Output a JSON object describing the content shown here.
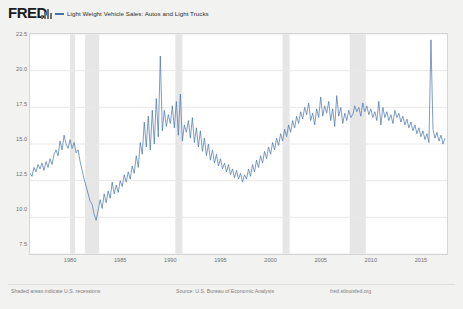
{
  "header": {
    "logo": "FRED",
    "logo_icon": "fred-bars-icon",
    "legend": [
      {
        "label": "Light Weight Vehicle Sales: Autos and Light Trucks",
        "color": "#4572a7"
      }
    ]
  },
  "footer": {
    "left_note": "Shaded areas indicate U.S. recessions",
    "source": "Source: U.S. Bureau of Economic Analysis",
    "site": "fred.stlouisfed.org"
  },
  "colors": {
    "series_line": "#4572a7",
    "recession_band": "#e6e6e6",
    "gridline": "#e8e8e8",
    "plot_background": "#ffffff",
    "page_background": "#f2f2f0",
    "axis_text": "#707070"
  },
  "chart_data": {
    "type": "line",
    "title": "Light Weight Vehicle Sales: Autos and Light Trucks",
    "xlabel": "",
    "ylabel": "Millions of Units",
    "ylim": [
      7.5,
      22.5
    ],
    "xlim": [
      1976.0,
      2017.6
    ],
    "ytick_labels": [
      "22.5",
      "20.0",
      "17.5",
      "15.0",
      "12.5",
      "10.0",
      "7.5"
    ],
    "ytick_values": [
      22.5,
      20.0,
      17.5,
      15.0,
      12.5,
      10.0,
      7.5
    ],
    "xtick_labels": [
      "1980",
      "1985",
      "1990",
      "1995",
      "2000",
      "2005",
      "2010",
      "2015"
    ],
    "xtick_values": [
      1980,
      1985,
      1990,
      1995,
      2000,
      2005,
      2010,
      2015
    ],
    "grid": true,
    "legend_position": "top-left",
    "annotations": [
      "Shaded areas indicate U.S. recessions",
      "Source: U.S. Bureau of Economic Analysis",
      "fred.stlouisfed.org"
    ],
    "recession_bands": [
      {
        "start": 1980.0,
        "end": 1980.5
      },
      {
        "start": 1981.5,
        "end": 1982.9
      },
      {
        "start": 1990.5,
        "end": 1991.2
      },
      {
        "start": 2001.2,
        "end": 2001.9
      },
      {
        "start": 2007.9,
        "end": 2009.5
      }
    ],
    "series": [
      {
        "name": "Light Weight Vehicle Sales: Autos and Light Trucks",
        "color": "#4572a7",
        "x": [
          1976.0,
          1976.2,
          1976.4,
          1976.6,
          1976.8,
          1977.0,
          1977.2,
          1977.4,
          1977.6,
          1977.8,
          1978.0,
          1978.2,
          1978.4,
          1978.6,
          1978.8,
          1979.0,
          1979.2,
          1979.4,
          1979.6,
          1979.8,
          1980.0,
          1980.2,
          1980.4,
          1980.6,
          1980.8,
          1981.0,
          1981.2,
          1981.4,
          1981.6,
          1981.8,
          1982.0,
          1982.2,
          1982.4,
          1982.6,
          1982.8,
          1983.0,
          1983.2,
          1983.4,
          1983.6,
          1983.8,
          1984.0,
          1984.2,
          1984.4,
          1984.6,
          1984.8,
          1985.0,
          1985.2,
          1985.4,
          1985.6,
          1985.8,
          1986.0,
          1986.2,
          1986.4,
          1986.6,
          1986.8,
          1987.0,
          1987.2,
          1987.4,
          1987.6,
          1987.8,
          1988.0,
          1988.2,
          1988.4,
          1988.6,
          1988.8,
          1989.0,
          1989.2,
          1989.4,
          1989.6,
          1989.8,
          1990.0,
          1990.2,
          1990.4,
          1990.6,
          1990.8,
          1991.0,
          1991.2,
          1991.4,
          1991.6,
          1991.8,
          1992.0,
          1992.2,
          1992.4,
          1992.6,
          1992.8,
          1993.0,
          1993.2,
          1993.4,
          1993.6,
          1993.8,
          1994.0,
          1994.2,
          1994.4,
          1994.6,
          1994.8,
          1995.0,
          1995.2,
          1995.4,
          1995.6,
          1995.8,
          1996.0,
          1996.2,
          1996.4,
          1996.6,
          1996.8,
          1997.0,
          1997.2,
          1997.4,
          1997.6,
          1997.8,
          1998.0,
          1998.2,
          1998.4,
          1998.6,
          1998.8,
          1999.0,
          1999.2,
          1999.4,
          1999.6,
          1999.8,
          2000.0,
          2000.2,
          2000.4,
          2000.6,
          2000.8,
          2001.0,
          2001.2,
          2001.4,
          2001.6,
          2001.8,
          2002.0,
          2002.2,
          2002.4,
          2002.6,
          2002.8,
          2003.0,
          2003.2,
          2003.4,
          2003.6,
          2003.8,
          2004.0,
          2004.2,
          2004.4,
          2004.6,
          2004.8,
          2005.0,
          2005.2,
          2005.4,
          2005.6,
          2005.8,
          2006.0,
          2006.2,
          2006.4,
          2006.6,
          2006.8,
          2007.0,
          2007.2,
          2007.4,
          2007.6,
          2007.8,
          2008.0,
          2008.2,
          2008.4,
          2008.6,
          2008.8,
          2009.0,
          2009.2,
          2009.4,
          2009.6,
          2009.8,
          2010.0,
          2010.2,
          2010.4,
          2010.6,
          2010.8,
          2011.0,
          2011.2,
          2011.4,
          2011.6,
          2011.8,
          2012.0,
          2012.2,
          2012.4,
          2012.6,
          2012.8,
          2013.0,
          2013.2,
          2013.4,
          2013.6,
          2013.8,
          2014.0,
          2014.2,
          2014.4,
          2014.6,
          2014.8,
          2015.0,
          2015.2,
          2015.4,
          2015.6,
          2015.8,
          2016.0,
          2016.2,
          2016.4,
          2016.6,
          2016.8,
          2017.0,
          2017.2,
          2017.4
        ],
        "y": [
          13.0,
          12.8,
          13.4,
          13.1,
          13.6,
          13.3,
          13.7,
          13.2,
          13.8,
          13.4,
          14.0,
          13.6,
          14.3,
          14.6,
          14.2,
          15.2,
          14.6,
          15.6,
          15.0,
          14.7,
          15.3,
          14.7,
          15.1,
          14.4,
          14.6,
          13.8,
          13.2,
          12.6,
          12.1,
          11.6,
          11.1,
          10.9,
          10.2,
          9.8,
          10.5,
          11.2,
          10.6,
          11.6,
          11.0,
          11.8,
          11.3,
          12.4,
          11.6,
          12.2,
          11.7,
          12.5,
          12.1,
          12.9,
          12.4,
          13.1,
          12.6,
          13.5,
          13.0,
          14.2,
          13.4,
          15.1,
          14.3,
          16.5,
          14.8,
          16.9,
          14.6,
          17.3,
          15.0,
          18.1,
          15.5,
          21.0,
          15.9,
          17.3,
          16.2,
          17.0,
          16.4,
          17.6,
          16.1,
          17.9,
          15.6,
          18.4,
          15.2,
          16.3,
          15.8,
          16.6,
          15.4,
          16.8,
          15.1,
          16.1,
          14.8,
          15.9,
          14.5,
          15.4,
          14.2,
          15.0,
          13.9,
          14.6,
          13.7,
          14.3,
          13.5,
          14.0,
          13.3,
          13.7,
          13.1,
          13.6,
          12.9,
          13.3,
          12.7,
          13.2,
          12.6,
          13.0,
          12.4,
          12.9,
          12.6,
          13.3,
          12.8,
          13.6,
          13.1,
          13.9,
          13.4,
          14.2,
          13.7,
          14.5,
          14.0,
          14.8,
          14.3,
          15.1,
          14.6,
          15.4,
          14.9,
          15.7,
          15.2,
          16.0,
          15.5,
          16.3,
          15.8,
          16.6,
          16.1,
          16.9,
          16.4,
          17.2,
          16.7,
          17.5,
          17.0,
          17.8,
          16.6,
          17.1,
          16.3,
          17.4,
          16.8,
          18.2,
          16.9,
          17.6,
          17.1,
          17.9,
          16.6,
          17.4,
          16.2,
          18.3,
          16.9,
          17.5,
          16.4,
          17.1,
          16.6,
          17.3,
          16.8,
          17.0,
          17.6,
          17.2,
          17.5,
          16.9,
          17.8,
          17.2,
          17.6,
          17.0,
          17.4,
          16.8,
          17.2,
          16.6,
          17.9,
          16.3,
          17.5,
          16.8,
          17.2,
          16.6,
          17.0,
          16.4,
          17.3,
          16.8,
          17.1,
          16.5,
          16.9,
          16.3,
          16.7,
          16.1,
          16.5,
          15.9,
          16.3,
          15.7,
          16.1,
          15.5,
          15.9,
          15.3,
          15.7,
          15.1,
          22.1,
          16.0,
          15.4,
          15.8,
          15.2,
          15.6,
          15.0,
          15.4
        ]
      }
    ]
  }
}
